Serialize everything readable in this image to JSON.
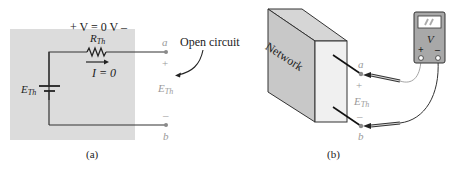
{
  "figure": {
    "panel_a": {
      "caption": "(a)",
      "voltage_label": "+ V = 0 V –",
      "resistor_label": {
        "base": "R",
        "sub": "Th"
      },
      "current_label": "I = 0",
      "source_label": {
        "base": "E",
        "sub": "Th"
      },
      "terminal_a": "a",
      "terminal_b": "b",
      "plus": "+",
      "minus": "–",
      "output_label": {
        "base": "E",
        "sub": "Th"
      },
      "annotation": "Open circuit"
    },
    "panel_b": {
      "caption": "(b)",
      "network_label": "Network",
      "meter_label": "V",
      "meter_plus": "+",
      "meter_minus": "–",
      "terminal_a": "a",
      "terminal_b": "b",
      "plus": "+",
      "minus": "–",
      "output_label": {
        "base": "E",
        "sub": "Th"
      }
    },
    "colors": {
      "panel_bg": "#dcdcdc",
      "wire": "#333333",
      "terminal_dot": "#8a8a8a",
      "box_front": "#f0f0f0",
      "box_side": "#c8c8c8",
      "box_top": "#d6d6d6",
      "meter_body": "#a8a8a8",
      "meter_screen": "#ffffff"
    }
  }
}
